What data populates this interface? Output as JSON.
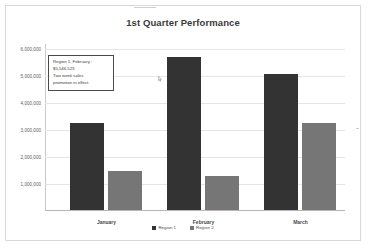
{
  "chart_data": {
    "type": "bar",
    "title": "1st Quarter Performance",
    "xlabel": "",
    "ylabel": "",
    "categories": [
      "January",
      "February",
      "March"
    ],
    "series": [
      {
        "name": "Region 1",
        "values": [
          3150000,
          5546523,
          4930000
        ],
        "color": "#333333"
      },
      {
        "name": "Region 2",
        "values": [
          1410000,
          1220000,
          3150000
        ]
      }
    ],
    "ylim": [
      0,
      6000000
    ],
    "y_ticks": [
      6000000,
      5000000,
      4000000,
      3000000,
      2000000,
      1000000
    ],
    "y_tick_labels": [
      "6,000,000",
      "5,000,000",
      "4,000,000",
      "3,000,000",
      "2,000,000",
      "1,000,000"
    ],
    "grid": true,
    "legend_position": "bottom",
    "annotations": [
      {
        "name": "region1-february-callout",
        "lines": [
          "Region 1, February :",
          "$5,546,523",
          "Two week sales",
          "promotion in effect."
        ]
      }
    ],
    "colors": {
      "series_1": "#333333",
      "series_2": "#767676",
      "title": "#3a3a3a",
      "gridline": "#e6e6e6",
      "plot_background": "#ffffff"
    }
  },
  "legend": {
    "items": [
      {
        "label": "Region 1"
      },
      {
        "label": "Region 2"
      }
    ]
  }
}
